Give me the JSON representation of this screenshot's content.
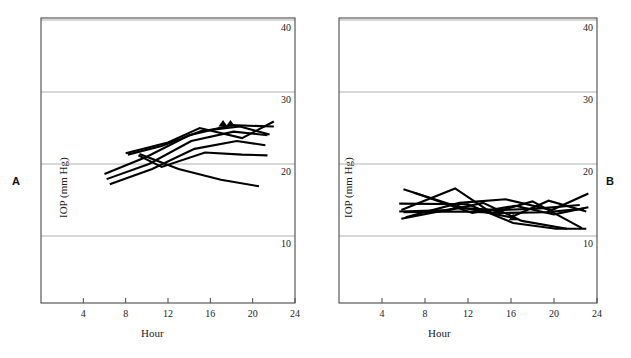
{
  "figure": {
    "panels": [
      {
        "id": "A",
        "label": "A",
        "xlabel": "Hour",
        "ylabel": "IOP (mm Hg)"
      },
      {
        "id": "B",
        "label": "B",
        "xlabel": "Hour",
        "ylabel": "IOP (mm Hg)"
      }
    ]
  },
  "chart_data": [
    {
      "type": "line",
      "panel": "A",
      "title": "",
      "xlabel": "Hour",
      "ylabel": "IOP (mm Hg)",
      "xlim": [
        0,
        24
      ],
      "ylim": [
        0,
        42
      ],
      "xticks": [
        4,
        8,
        12,
        16,
        20,
        24
      ],
      "yticks": [
        10,
        20,
        30,
        40
      ],
      "ytick_labels": [
        "10",
        "20",
        "30",
        "40"
      ],
      "xtick_labels": [
        "4",
        "8",
        "12",
        "16",
        "20",
        "24"
      ],
      "grid": true,
      "grid_axis": "y",
      "y_axis_label_position": "right-inside",
      "legend": "none",
      "marker": "triangle",
      "series": [
        {
          "name": "subject-1",
          "x": [
            6.0,
            10.0,
            14.0,
            18.0,
            22.0
          ],
          "y": [
            18.6,
            21.0,
            24.0,
            25.4,
            25.2
          ]
        },
        {
          "name": "subject-2",
          "x": [
            6.2,
            10.2,
            14.2,
            18.2,
            21.4
          ],
          "y": [
            17.9,
            20.0,
            23.2,
            24.5,
            24.0
          ]
        },
        {
          "name": "subject-3",
          "x": [
            6.5,
            10.5,
            14.5,
            18.5,
            21.2
          ],
          "y": [
            17.2,
            19.3,
            22.1,
            23.2,
            22.6
          ]
        },
        {
          "name": "subject-4",
          "x": [
            8.0,
            12.0,
            15.0,
            19.0,
            22.0
          ],
          "y": [
            21.5,
            23.0,
            25.0,
            23.6,
            25.9
          ]
        },
        {
          "name": "subject-5",
          "x": [
            8.2,
            11.4,
            15.2,
            18.8,
            21.6
          ],
          "y": [
            21.3,
            22.5,
            24.6,
            25.2,
            24.1
          ]
        },
        {
          "name": "subject-6",
          "x": [
            9.2,
            11.4,
            15.5,
            19.0,
            21.4
          ],
          "y": [
            21.2,
            19.6,
            21.6,
            21.3,
            21.2
          ]
        },
        {
          "name": "subject-7",
          "x": [
            9.3,
            13.0,
            17.0,
            20.6
          ],
          "y": [
            21.4,
            19.3,
            17.8,
            16.9
          ]
        }
      ],
      "markers": [
        {
          "x": 17.2,
          "y": 25.4
        },
        {
          "x": 17.9,
          "y": 25.4
        }
      ]
    },
    {
      "type": "line",
      "panel": "B",
      "title": "",
      "xlabel": "Hour",
      "ylabel": "IOP (mm Hg)",
      "xlim": [
        0,
        24
      ],
      "ylim": [
        0,
        42
      ],
      "xticks": [
        4,
        8,
        12,
        16,
        20,
        24
      ],
      "yticks": [
        10,
        20,
        30,
        40
      ],
      "ytick_labels": [
        "10",
        "20",
        "30",
        "40"
      ],
      "xtick_labels": [
        "4",
        "8",
        "12",
        "16",
        "20",
        "24"
      ],
      "grid": true,
      "grid_axis": "y",
      "y_axis_label_position": "right-inside",
      "legend": "none",
      "marker": "triangle",
      "series": [
        {
          "name": "subject-1",
          "x": [
            6.0,
            11.0,
            16.0,
            19.5,
            23.0
          ],
          "y": [
            16.5,
            14.1,
            12.6,
            14.9,
            13.4
          ]
        },
        {
          "name": "subject-2",
          "x": [
            6.2,
            11.2,
            15.5,
            19.8,
            23.2
          ],
          "y": [
            12.6,
            14.6,
            15.1,
            13.6,
            15.9
          ]
        },
        {
          "name": "subject-3",
          "x": [
            5.8,
            10.8,
            14.2,
            18.0,
            22.6
          ],
          "y": [
            13.6,
            16.6,
            13.2,
            14.8,
            11.1
          ]
        },
        {
          "name": "subject-4",
          "x": [
            5.6,
            10.2,
            13.4,
            17.0,
            21.2
          ],
          "y": [
            13.4,
            13.6,
            14.6,
            12.1,
            11.0
          ]
        },
        {
          "name": "subject-5",
          "x": [
            5.6,
            12.0,
            16.2,
            20.2,
            23.0
          ],
          "y": [
            14.5,
            14.4,
            11.8,
            11.0,
            11.0
          ]
        },
        {
          "name": "subject-6",
          "x": [
            6.0,
            11.6,
            15.0,
            19.2,
            22.8
          ],
          "y": [
            13.3,
            13.4,
            13.2,
            13.3,
            13.8
          ]
        },
        {
          "name": "subject-7",
          "x": [
            5.8,
            11.0,
            14.8,
            18.4,
            22.4
          ],
          "y": [
            12.4,
            13.9,
            13.6,
            13.8,
            14.3
          ]
        },
        {
          "name": "subject-8",
          "x": [
            7.0,
            12.4,
            16.4,
            20.0,
            23.2
          ],
          "y": [
            16.0,
            13.2,
            14.2,
            13.0,
            14.0
          ]
        }
      ],
      "markers": [
        {
          "x": 11.0,
          "y": 14.0
        },
        {
          "x": 16.2,
          "y": 12.4
        }
      ]
    }
  ]
}
